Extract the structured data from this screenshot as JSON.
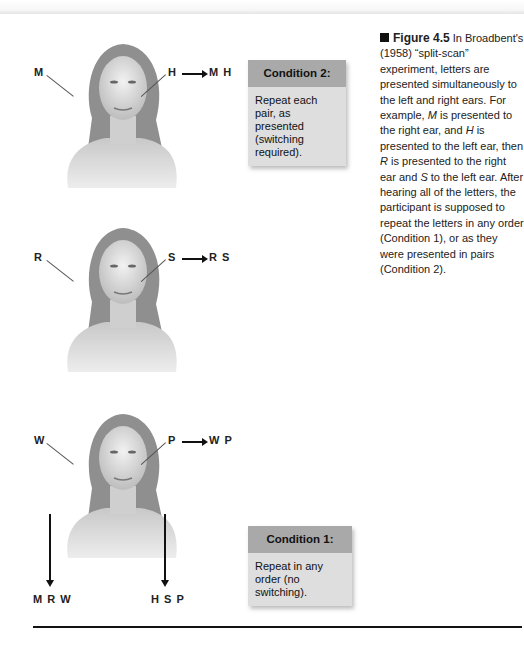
{
  "figure": {
    "label": "Figure 4.5",
    "caption_parts": [
      {
        "text": " In Broadbent's (1958) “split-scan” experiment, letters are presented simultaneously to the left and right ears. For example, ",
        "italic": false
      },
      {
        "text": "M",
        "italic": true
      },
      {
        "text": " is presented to the right ear, and ",
        "italic": false
      },
      {
        "text": "H",
        "italic": true
      },
      {
        "text": " is presented to the left ear, then ",
        "italic": false
      },
      {
        "text": "R",
        "italic": true
      },
      {
        "text": " is presented to the right ear and ",
        "italic": false
      },
      {
        "text": "S",
        "italic": true
      },
      {
        "text": " to the left ear. After hearing all of the letters, the participant is supposed to repeat the letters in any order (Condition 1), or as they were presented in pairs (Condition 2).",
        "italic": false
      }
    ]
  },
  "heads": [
    {
      "left_letter": "M",
      "right_letter": "H",
      "pair_output": "M H"
    },
    {
      "left_letter": "R",
      "right_letter": "S",
      "pair_output": "R S"
    },
    {
      "left_letter": "W",
      "right_letter": "P",
      "pair_output": "W P"
    }
  ],
  "sequence_outputs": {
    "left_ear_sequence": "M R W",
    "right_ear_sequence": "H S P"
  },
  "conditions": {
    "condition2": {
      "title": "Condition 2:",
      "text": "Repeat each pair, as presented (switching required)."
    },
    "condition1": {
      "title": "Condition 1:",
      "text": "Repeat in any order (no switching)."
    }
  },
  "colors": {
    "box_header": "#a9a9a9",
    "box_body": "#dedede",
    "text": "#1a1a1a"
  }
}
